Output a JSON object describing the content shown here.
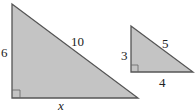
{
  "diagram": {
    "colors": {
      "fill": "#c4c4c4",
      "stroke": "#555555",
      "text": "#222222"
    },
    "large_triangle": {
      "vertical_leg": "6",
      "hypotenuse": "10",
      "horizontal_leg": "x"
    },
    "small_triangle": {
      "vertical_leg": "3",
      "hypotenuse": "5",
      "horizontal_leg": "4"
    }
  }
}
